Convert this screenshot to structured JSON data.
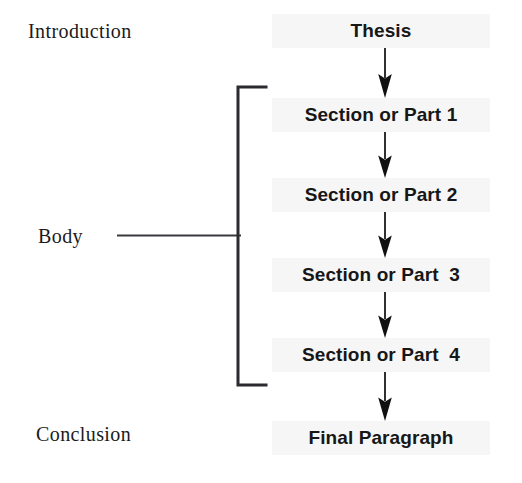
{
  "diagram": {
    "background_color": "#ffffff",
    "node_band_color": "#f6f6f7",
    "ink_color": "#171717",
    "stage_labels": [
      {
        "id": "introduction",
        "text": "Introduction"
      },
      {
        "id": "body",
        "text": "Body"
      },
      {
        "id": "conclusion",
        "text": "Conclusion"
      }
    ],
    "nodes": [
      {
        "id": "thesis",
        "text": "Thesis",
        "stage": "introduction"
      },
      {
        "id": "section-1",
        "text": "Section or Part 1",
        "stage": "body"
      },
      {
        "id": "section-2",
        "text": "Section or Part 2",
        "stage": "body"
      },
      {
        "id": "section-3",
        "text": "Section or Part  3",
        "stage": "body"
      },
      {
        "id": "section-4",
        "text": "Section or Part  4",
        "stage": "body"
      },
      {
        "id": "final",
        "text": "Final Paragraph",
        "stage": "conclusion"
      }
    ],
    "arrows": [
      {
        "id": "arrow-1",
        "from": "thesis",
        "to": "section-1",
        "direction": "down"
      },
      {
        "id": "arrow-2",
        "from": "section-1",
        "to": "section-2",
        "direction": "down"
      },
      {
        "id": "arrow-3",
        "from": "section-2",
        "to": "section-3",
        "direction": "down"
      },
      {
        "id": "arrow-4",
        "from": "section-3",
        "to": "section-4",
        "direction": "down"
      },
      {
        "id": "arrow-5",
        "from": "section-4",
        "to": "final",
        "direction": "down"
      }
    ],
    "bracket": {
      "id": "body-bracket",
      "groups": [
        "section-1",
        "section-2",
        "section-3",
        "section-4"
      ],
      "label": "Body",
      "orientation": "left"
    }
  }
}
